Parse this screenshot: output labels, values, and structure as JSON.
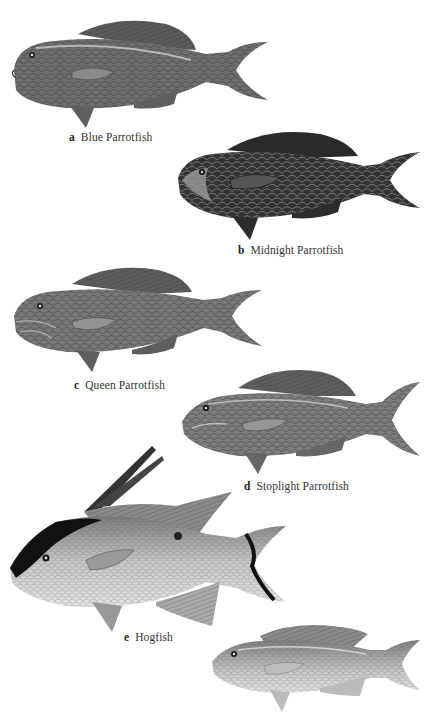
{
  "plate": {
    "figures": [
      {
        "letter": "a",
        "name": "Blue Parrotfish",
        "shade": "#6e6e6e",
        "dark": "#3e3e3e"
      },
      {
        "letter": "b",
        "name": "Midnight Parrotfish",
        "shade": "#3a3a3a",
        "dark": "#151515"
      },
      {
        "letter": "c",
        "name": "Queen Parrotfish",
        "shade": "#757575",
        "dark": "#444444"
      },
      {
        "letter": "d",
        "name": "Stoplight Parrotfish",
        "shade": "#7c7c7c",
        "dark": "#4a4a4a"
      },
      {
        "letter": "e",
        "name": "Hogfish",
        "shade": "#a8a8a8",
        "dark": "#1a1a1a"
      },
      {
        "letter": "",
        "name": "",
        "shade": "#b8b8b8",
        "dark": "#6a6a6a"
      }
    ]
  }
}
